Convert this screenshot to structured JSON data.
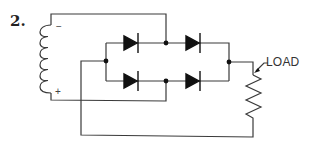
{
  "figure": {
    "number_label": "2.",
    "load_label": "LOAD",
    "coil_top_polarity": "−",
    "coil_bottom_polarity": "+",
    "colors": {
      "line": "#3a3a3a",
      "fill": "#111111",
      "background": "#ffffff"
    }
  },
  "components": {
    "source": {
      "type": "inductor-coil",
      "turns": 6,
      "top_terminal": "negative",
      "bottom_terminal": "positive"
    },
    "rectifier": {
      "type": "full-wave-bridge",
      "diode_count": 4,
      "rows": [
        "top",
        "bottom"
      ],
      "diodes_per_row": 2,
      "diode_direction": "left-to-right"
    },
    "load": {
      "type": "variable-resistor",
      "label": "LOAD"
    }
  }
}
